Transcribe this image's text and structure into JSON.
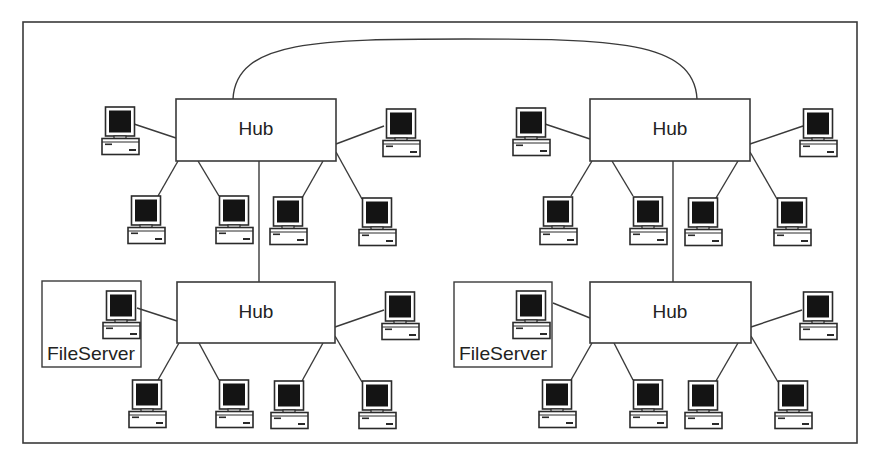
{
  "diagram": {
    "title": "",
    "type": "hierarchical star network (hubs linked in tree/backbone)",
    "colors": {
      "line": "#3a3a3a",
      "screen": "#141414",
      "background": "#ffffff"
    },
    "frame": {
      "x": 23,
      "y": 22,
      "width": 834,
      "height": 421
    },
    "backbone_arc": {
      "from": "hub-top-left",
      "to": "hub-top-right"
    },
    "hubs": [
      {
        "id": "hub-top-left",
        "label": "Hub",
        "x": 176,
        "y": 99,
        "width": 160,
        "height": 62
      },
      {
        "id": "hub-bottom-left",
        "label": "Hub",
        "x": 177,
        "y": 282,
        "width": 158,
        "height": 61
      },
      {
        "id": "hub-top-right",
        "label": "Hub",
        "x": 590,
        "y": 99,
        "width": 160,
        "height": 62
      },
      {
        "id": "hub-bottom-right",
        "label": "Hub",
        "x": 590,
        "y": 282,
        "width": 161,
        "height": 61
      }
    ],
    "hub_links": [
      {
        "from": "hub-top-left",
        "to": "hub-bottom-left"
      },
      {
        "from": "hub-top-right",
        "to": "hub-bottom-right"
      },
      {
        "from": "hub-top-left",
        "to": "hub-top-right"
      }
    ],
    "file_servers": [
      {
        "label": "FileServer",
        "hub": "hub-bottom-left",
        "box": {
          "x": 42,
          "y": 281,
          "width": 99,
          "height": 86
        }
      },
      {
        "label": "FileServer",
        "hub": "hub-bottom-right",
        "box": {
          "x": 454,
          "y": 282,
          "width": 98,
          "height": 85
        }
      }
    ],
    "workstations_per_hub": 6,
    "total_workstations": 24,
    "total_file_servers": 2
  }
}
